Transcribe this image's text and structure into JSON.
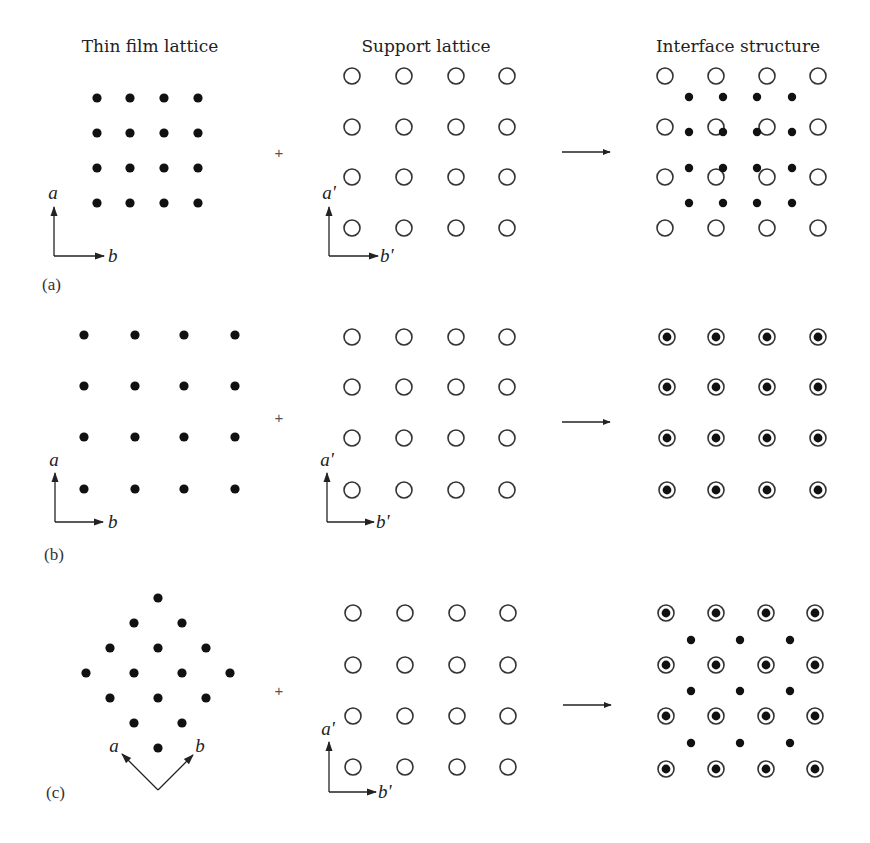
{
  "column_titles": {
    "thin_film": "Thin film lattice",
    "support": "Support lattice",
    "interface": "Interface structure"
  },
  "operators": {
    "plus": "+"
  },
  "colors": {
    "atom_fill": "#111111",
    "ring_stroke": "#333333",
    "background": "#ffffff"
  },
  "panels": [
    {
      "label": "(a)",
      "thin_film": {
        "arrangement": "square 4x4, smaller spacing than support",
        "axes": [
          "a",
          "b"
        ]
      },
      "support": {
        "arrangement": "square 4x4 open circles",
        "axes": [
          "a'",
          "b'"
        ]
      },
      "interface": {
        "arrangement": "incommensurate overlay: film atoms offset between support sites"
      }
    },
    {
      "label": "(b)",
      "thin_film": {
        "arrangement": "square 4x4, same spacing as support",
        "axes": [
          "a",
          "b"
        ]
      },
      "support": {
        "arrangement": "square 4x4 open circles",
        "axes": [
          "a'",
          "b'"
        ]
      },
      "interface": {
        "arrangement": "commensurate 1x1: every film atom sits on a support site"
      }
    },
    {
      "label": "(c)",
      "thin_film": {
        "arrangement": "square lattice rotated 45 degrees (diamond)",
        "axes": [
          "a",
          "b"
        ]
      },
      "support": {
        "arrangement": "square 4x4 open circles",
        "axes": [
          "a'",
          "b'"
        ]
      },
      "interface": {
        "arrangement": "coincidence: film atoms on support sites plus at centers of support cells"
      }
    }
  ]
}
